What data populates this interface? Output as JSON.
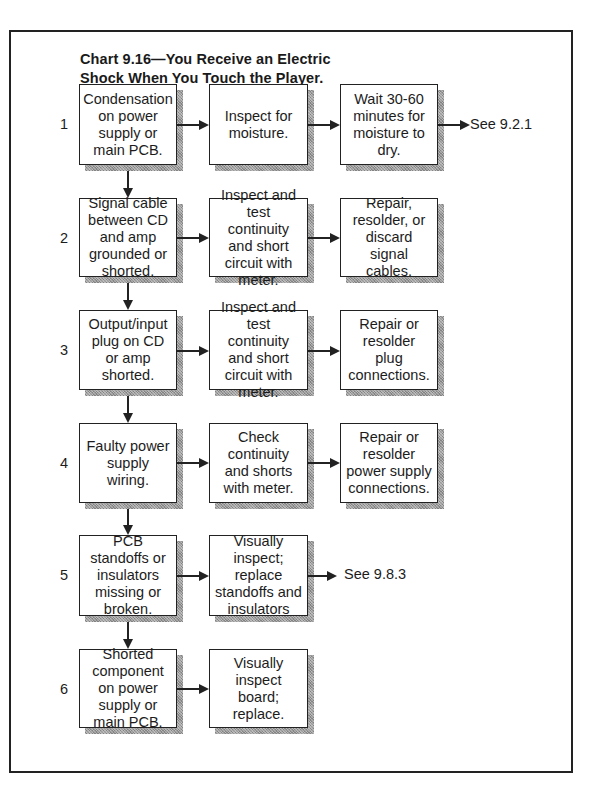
{
  "chart": {
    "title_line1": "Chart 9.16—You Receive an Electric",
    "title_line2": "Shock When You Touch the Player."
  },
  "rows": [
    {
      "number": "1",
      "cause": "Condensation on power supply or main PCB.",
      "check": "Inspect for moisture.",
      "remedy": "Wait 30-60 minutes for moisture to dry.",
      "reference": "See 9.2.1"
    },
    {
      "number": "2",
      "cause": "Signal cable between CD and amp grounded or shorted.",
      "check": "Inspect and test continuity and short circuit with meter.",
      "remedy": "Repair, resolder, or discard signal cables."
    },
    {
      "number": "3",
      "cause": "Output/input plug on CD or amp shorted.",
      "check": "Inspect and test continuity and short circuit with meter.",
      "remedy": "Repair or resolder plug connections."
    },
    {
      "number": "4",
      "cause": "Faulty power supply wiring.",
      "check": "Check continuity and shorts with meter.",
      "remedy": "Repair or resolder power supply connections."
    },
    {
      "number": "5",
      "cause": "PCB standoffs or insulators missing or broken.",
      "check": "Visually inspect; replace standoffs and insulators",
      "reference": "See 9.8.3"
    },
    {
      "number": "6",
      "cause": "Shorted component on power supply or main PCB.",
      "check": "Visually inspect board; replace."
    }
  ]
}
